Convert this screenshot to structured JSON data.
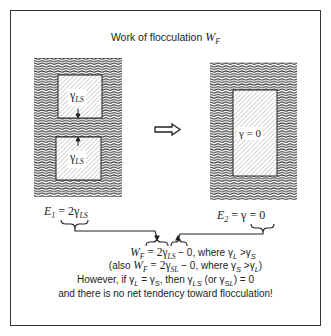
{
  "figure": {
    "title_text": "Work of flocculation ",
    "title_var": "W",
    "title_sub": "F",
    "left_panel": {
      "particle_top_label": "γ",
      "particle_top_sub": "LS",
      "particle_bottom_label": "γ",
      "particle_bottom_sub": "LS",
      "energy_label_prefix": "E",
      "energy_label_sub": "1",
      "energy_label_rest": " = 2γ",
      "energy_label_rest_sub": "LS"
    },
    "arrow": "⇨",
    "right_panel": {
      "particle_label": "γ = 0",
      "energy_label_prefix": "E",
      "energy_label_sub": "2",
      "energy_label_rest": " = γ = 0"
    },
    "equations": {
      "line1": {
        "a": "W",
        "a_sub": "F",
        "b": " = 2γ",
        "b_sub": "LS",
        "c": " − 0, where γ",
        "c_sub": "L",
        "d": " >γ",
        "d_sub": "S"
      },
      "line2": {
        "pre": "(also ",
        "a": "W",
        "a_sub": "F",
        "b": " = 2γ",
        "b_sub": "SL",
        "c": " − 0, where γ",
        "c_sub": "S",
        "d": " >γ",
        "d_sub": "L",
        "post": ")"
      },
      "line3": {
        "pre": "However, if ",
        "a": "γ",
        "a_sub": "L",
        "b": " = γ",
        "b_sub": "S",
        "c": ", then γ",
        "c_sub": "LS",
        "d": " (or γ",
        "d_sub": "SL",
        "post": ") = 0"
      },
      "line4": "and there is no net tendency toward flocculation!"
    }
  }
}
